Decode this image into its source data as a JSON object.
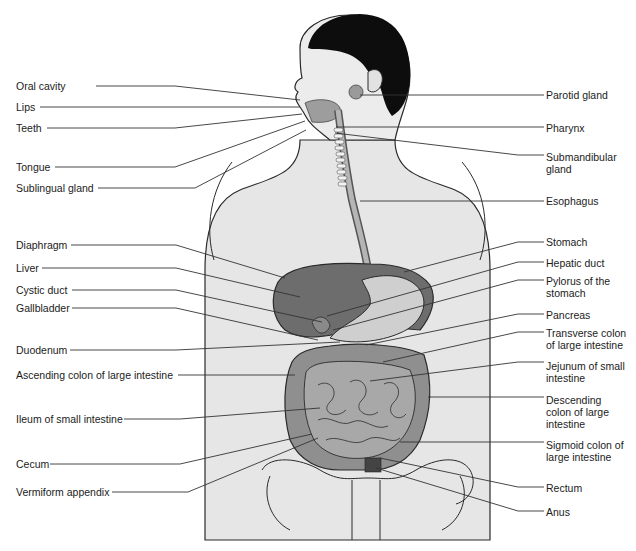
{
  "diagram": {
    "left_labels": [
      {
        "id": "oral-cavity",
        "text": "Oral cavity",
        "x": 16,
        "y": 80,
        "line": [
          [
            96,
            86
          ],
          [
            175,
            86
          ],
          [
            300,
            100
          ]
        ]
      },
      {
        "id": "lips",
        "text": "Lips",
        "x": 16,
        "y": 101,
        "line": [
          [
            40,
            107
          ],
          [
            300,
            107
          ]
        ]
      },
      {
        "id": "teeth",
        "text": "Teeth",
        "x": 16,
        "y": 122,
        "line": [
          [
            47,
            128
          ],
          [
            175,
            128
          ],
          [
            302,
            114
          ]
        ]
      },
      {
        "id": "tongue",
        "text": "Tongue",
        "x": 16,
        "y": 161,
        "line": [
          [
            55,
            167
          ],
          [
            175,
            167
          ],
          [
            305,
            121
          ]
        ]
      },
      {
        "id": "sublingual-gland",
        "text": "Sublingual gland",
        "x": 16,
        "y": 182,
        "line": [
          [
            98,
            188
          ],
          [
            195,
            188
          ],
          [
            306,
            130
          ]
        ]
      },
      {
        "id": "diaphragm",
        "text": "Diaphragm",
        "x": 16,
        "y": 239,
        "line": [
          [
            71,
            245
          ],
          [
            176,
            245
          ],
          [
            285,
            278
          ]
        ]
      },
      {
        "id": "liver",
        "text": "Liver",
        "x": 16,
        "y": 262,
        "line": [
          [
            42,
            268
          ],
          [
            176,
            268
          ],
          [
            300,
            297
          ]
        ]
      },
      {
        "id": "cystic-duct",
        "text": "Cystic duct",
        "x": 16,
        "y": 284,
        "line": [
          [
            72,
            290
          ],
          [
            176,
            290
          ],
          [
            322,
            322
          ]
        ]
      },
      {
        "id": "gallbladder",
        "text": "Gallbladder",
        "x": 16,
        "y": 302,
        "line": [
          [
            72,
            308
          ],
          [
            176,
            308
          ],
          [
            318,
            340
          ]
        ]
      },
      {
        "id": "duodenum",
        "text": "Duodenum",
        "x": 16,
        "y": 344,
        "line": [
          [
            70,
            350
          ],
          [
            176,
            350
          ],
          [
            340,
            342
          ]
        ]
      },
      {
        "id": "ascending-colon",
        "text": "Ascending colon of large intestine",
        "x": 16,
        "y": 369,
        "line": [
          [
            178,
            375
          ],
          [
            295,
            375
          ]
        ]
      },
      {
        "id": "ileum",
        "text": "Ileum of small intestine",
        "x": 16,
        "y": 413,
        "line": [
          [
            124,
            419
          ],
          [
            180,
            419
          ],
          [
            320,
            408
          ]
        ]
      },
      {
        "id": "cecum",
        "text": "Cecum",
        "x": 16,
        "y": 458,
        "line": [
          [
            50,
            464
          ],
          [
            180,
            464
          ],
          [
            312,
            434
          ]
        ]
      },
      {
        "id": "vermiform-appendix",
        "text": "Vermiform appendix",
        "x": 16,
        "y": 486,
        "line": [
          [
            112,
            492
          ],
          [
            188,
            492
          ],
          [
            318,
            438
          ]
        ]
      }
    ],
    "right_labels": [
      {
        "id": "parotid-gland",
        "text": "Parotid gland",
        "x": 546,
        "y": 89,
        "line": [
          [
            360,
            95
          ],
          [
            544,
            95
          ]
        ]
      },
      {
        "id": "pharynx",
        "text": "Pharynx",
        "x": 546,
        "y": 122,
        "line": [
          [
            336,
            127
          ],
          [
            544,
            127
          ]
        ]
      },
      {
        "id": "submandibular-gland",
        "text": "Submandibular gland",
        "x": 546,
        "y": 151,
        "line": [
          [
            335,
            133
          ],
          [
            518,
            155
          ],
          [
            544,
            155
          ]
        ]
      },
      {
        "id": "esophagus",
        "text": "Esophagus",
        "x": 546,
        "y": 195,
        "line": [
          [
            360,
            201
          ],
          [
            544,
            201
          ]
        ]
      },
      {
        "id": "stomach",
        "text": "Stomach",
        "x": 546,
        "y": 236,
        "line": [
          [
            404,
            272
          ],
          [
            518,
            242
          ],
          [
            544,
            242
          ]
        ]
      },
      {
        "id": "hepatic-duct",
        "text": "Hepatic duct",
        "x": 546,
        "y": 257,
        "line": [
          [
            327,
            316
          ],
          [
            518,
            262
          ],
          [
            544,
            262
          ]
        ]
      },
      {
        "id": "pylorus",
        "text": "Pylorus of the stomach",
        "x": 546,
        "y": 275,
        "line": [
          [
            333,
            330
          ],
          [
            518,
            280
          ],
          [
            544,
            280
          ]
        ]
      },
      {
        "id": "pancreas",
        "text": "Pancreas",
        "x": 546,
        "y": 309,
        "line": [
          [
            366,
            345
          ],
          [
            518,
            314
          ],
          [
            544,
            314
          ]
        ]
      },
      {
        "id": "transverse-colon",
        "text": "Transverse colon of large intestine",
        "x": 546,
        "y": 327,
        "line": [
          [
            383,
            362
          ],
          [
            518,
            332
          ],
          [
            544,
            332
          ]
        ]
      },
      {
        "id": "jejunum",
        "text": "Jejunum of small intestine",
        "x": 546,
        "y": 360,
        "line": [
          [
            370,
            381
          ],
          [
            518,
            362
          ],
          [
            544,
            362
          ]
        ]
      },
      {
        "id": "descending-colon",
        "text": "Descending colon of large intestine",
        "x": 546,
        "y": 394,
        "line": [
          [
            428,
            397
          ],
          [
            544,
            397
          ]
        ]
      },
      {
        "id": "sigmoid-colon",
        "text": "Sigmoid colon of large intestine",
        "x": 546,
        "y": 439,
        "line": [
          [
            400,
            442
          ],
          [
            544,
            442
          ]
        ]
      },
      {
        "id": "rectum",
        "text": "Rectum",
        "x": 546,
        "y": 482,
        "line": [
          [
            380,
            458
          ],
          [
            518,
            487
          ],
          [
            544,
            487
          ]
        ]
      },
      {
        "id": "anus",
        "text": "Anus",
        "x": 546,
        "y": 506,
        "line": [
          [
            376,
            468
          ],
          [
            518,
            511
          ],
          [
            544,
            511
          ]
        ]
      }
    ],
    "colors": {
      "background": "#ffffff",
      "body_fill": "#e6e6e6",
      "outline": "#2a2a2a",
      "hair": "#0d0d0d",
      "liver": "#6d6d6d",
      "stomach": "#cfcfcf",
      "intestine": "#8f8f8f",
      "small_intestine": "#a8a8a8",
      "leader_line": "#333333"
    }
  }
}
